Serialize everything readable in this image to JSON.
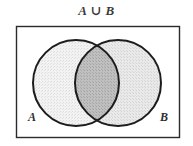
{
  "figure": {
    "title": "A ∪ B",
    "caption_symbol": "union"
  },
  "universe": {
    "name": "universal-set-rectangle",
    "border_color": "#2b2b2b",
    "fill_color": "#ffffff"
  },
  "sets": [
    {
      "id": "A",
      "label": "A",
      "label_position": "bottom-left",
      "cx": 76,
      "cy": 83,
      "r": 43,
      "fill_color": "#efefef",
      "stroke_color": "#1c1c1c"
    },
    {
      "id": "B",
      "label": "B",
      "label_position": "bottom-right",
      "cx": 118,
      "cy": 83,
      "r": 43,
      "fill_color": "#e6e6e6",
      "stroke_color": "#1c1c1c"
    }
  ],
  "regions": {
    "intersection_fill": "#bcbcbc",
    "union_shaded": "true"
  },
  "colors": {
    "background": "#ffffff",
    "ink": "#2b2b2b",
    "light_shade": "#ededed",
    "mid_shade": "#e4e4e4",
    "dark_shade": "#bcbcbc"
  }
}
